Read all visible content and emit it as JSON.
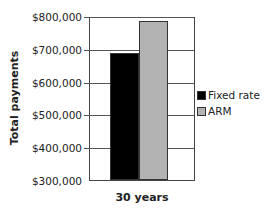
{
  "chart_data": {
    "type": "bar",
    "title": "",
    "xlabel": "",
    "ylabel": "Total payments",
    "categories": [
      "30 years"
    ],
    "series": [
      {
        "name": "Fixed rate",
        "values": [
          688000
        ],
        "color": "#000000"
      },
      {
        "name": "ARM",
        "values": [
          785000
        ],
        "color": "#b3b3b3"
      }
    ],
    "ylim": [
      300000,
      800000
    ],
    "yticks": [
      300000,
      400000,
      500000,
      600000,
      700000,
      800000
    ],
    "ytick_labels": [
      "$300,000",
      "$400,000",
      "$500,000",
      "$600,000",
      "$700,000",
      "$800,000"
    ],
    "grid": true,
    "legend_position": "right"
  }
}
